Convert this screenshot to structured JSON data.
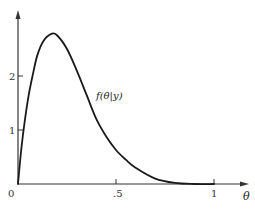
{
  "chart_data": {
    "type": "line",
    "title": "",
    "xlabel": "θ",
    "ylabel": "",
    "curve_label": "f(θ|y)",
    "xlim": [
      0,
      1.15
    ],
    "ylim": [
      0,
      3.2
    ],
    "grid": false,
    "legend": "none",
    "x_ticks": [
      {
        "value": 0,
        "label": "0"
      },
      {
        "value": 0.5,
        "label": ".5"
      },
      {
        "value": 1,
        "label": "1"
      }
    ],
    "y_ticks": [
      {
        "value": 1,
        "label": "1"
      },
      {
        "value": 2,
        "label": "2"
      }
    ],
    "series": [
      {
        "name": "f(θ|y)",
        "x": [
          0,
          0.02,
          0.05,
          0.08,
          0.1,
          0.13,
          0.17,
          0.2,
          0.25,
          0.3,
          0.35,
          0.4,
          0.45,
          0.5,
          0.55,
          0.6,
          0.7,
          0.8,
          0.9,
          1.0
        ],
        "values": [
          0,
          0.75,
          1.55,
          2.1,
          2.4,
          2.65,
          2.78,
          2.75,
          2.5,
          2.1,
          1.65,
          1.2,
          0.88,
          0.63,
          0.45,
          0.3,
          0.1,
          0.02,
          0.0,
          0
        ]
      }
    ],
    "color": "#1a1a1a"
  }
}
